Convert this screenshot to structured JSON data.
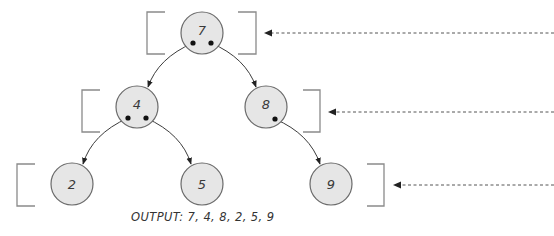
{
  "diagram": {
    "colors": {
      "node_fill": "#e6e6e6",
      "node_stroke": "#6a6a6a",
      "edge": "#3c3c3c",
      "bracket": "#8a8a8a",
      "level_arrow": "#555555",
      "text": "#333333"
    },
    "nodes": [
      {
        "id": "n7",
        "label": "7",
        "level": 0,
        "cx": 202,
        "cy": 33
      },
      {
        "id": "n4",
        "label": "4",
        "level": 1,
        "cx": 137,
        "cy": 107
      },
      {
        "id": "n8",
        "label": "8",
        "level": 1,
        "cx": 266,
        "cy": 107
      },
      {
        "id": "n2",
        "label": "2",
        "level": 2,
        "cx": 72,
        "cy": 184
      },
      {
        "id": "n5",
        "label": "5",
        "level": 2,
        "cx": 202,
        "cy": 184
      },
      {
        "id": "n9",
        "label": "9",
        "level": 2,
        "cx": 331,
        "cy": 184
      }
    ],
    "edges": [
      {
        "from": "7",
        "to": "4"
      },
      {
        "from": "7",
        "to": "8"
      },
      {
        "from": "4",
        "to": "2"
      },
      {
        "from": "4",
        "to": "5"
      },
      {
        "from": "8",
        "to": "9"
      }
    ],
    "levels": [
      {
        "level": 0,
        "nodes": [
          "7"
        ]
      },
      {
        "level": 1,
        "nodes": [
          "4",
          "8"
        ]
      },
      {
        "level": 2,
        "nodes": [
          "2",
          "5",
          "9"
        ]
      }
    ],
    "output": {
      "label": "OUTPUT:",
      "sequence": "7, 4, 8, 2, 5, 9",
      "full_text": "OUTPUT: 7, 4, 8, 2, 5, 9"
    }
  }
}
